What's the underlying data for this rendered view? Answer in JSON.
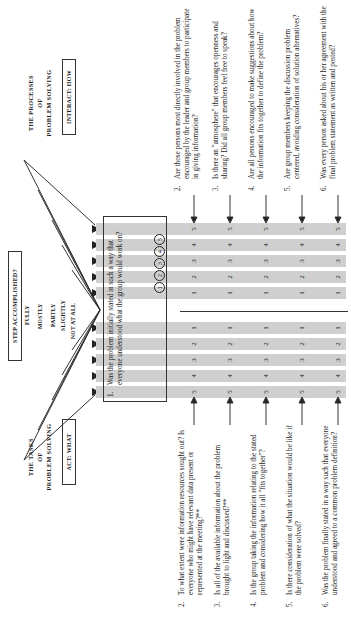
{
  "header": {
    "step_label": "STEP ACCOMPLISHED?"
  },
  "levels": [
    "FULLY",
    "MOSTLY",
    "PARTLY",
    "SLIGHTLY",
    "NOT AT ALL"
  ],
  "tasks": {
    "title_line1": "THE TASKS",
    "title_line2": "OF",
    "title_line3": "PROBLEM SOLVING",
    "box_label": "ACT: WHAT",
    "items": [
      {
        "num": "2.",
        "text": "To what extent were information resources sought out? Is everyone who might have relevant data present or represented at the meeting?**"
      },
      {
        "num": "3.",
        "text": "Is all of the available information about the problem brought to light and discussed?**"
      },
      {
        "num": "4.",
        "text": "Is the group taking the information relating to the stated problem and considering how it all \"fits together\"?"
      },
      {
        "num": "5.",
        "text": "Is there consideration of what the situation would be like if the problem were solved?"
      },
      {
        "num": "6.",
        "text": "Was the problem finally stated in a way such that everyone understood and agreed to a common problem definition?"
      }
    ]
  },
  "processes": {
    "title_line1": "THE PROCESSES",
    "title_line2": "OF",
    "title_line3": "PROBLEM SOLVING",
    "box_label": "INTERACT: HOW",
    "items": [
      {
        "num": "2.",
        "text": "Are those persons most directly involved in the problem encouraged by the leader and group members to participate in giving information?"
      },
      {
        "num": "3.",
        "text": "Is there an \"atmosphere\" that encourages openness and sharing? Did all group members feel free to speak?"
      },
      {
        "num": "4.",
        "text": "Are all persons encouraged to make suggestions about how the information fits together to define the problem?"
      },
      {
        "num": "5.",
        "text": "Are group members keeping the discussion problem centered, avoiding consideration of solution alternatives?"
      },
      {
        "num": "6.",
        "text": "Was every person asked about his or her agreement with the final problem statement as written and posted?"
      }
    ]
  },
  "item1": {
    "num": "1.",
    "text": "Was the problem initially stated in such a way that everyone understood what the group would work on?",
    "circles": [
      "1",
      "2",
      "3",
      "4",
      "5"
    ]
  },
  "scale": {
    "left_values": [
      "5",
      "4",
      "3",
      "2",
      "1"
    ],
    "right_values": [
      "1",
      "2",
      "3",
      "4",
      "5"
    ]
  }
}
